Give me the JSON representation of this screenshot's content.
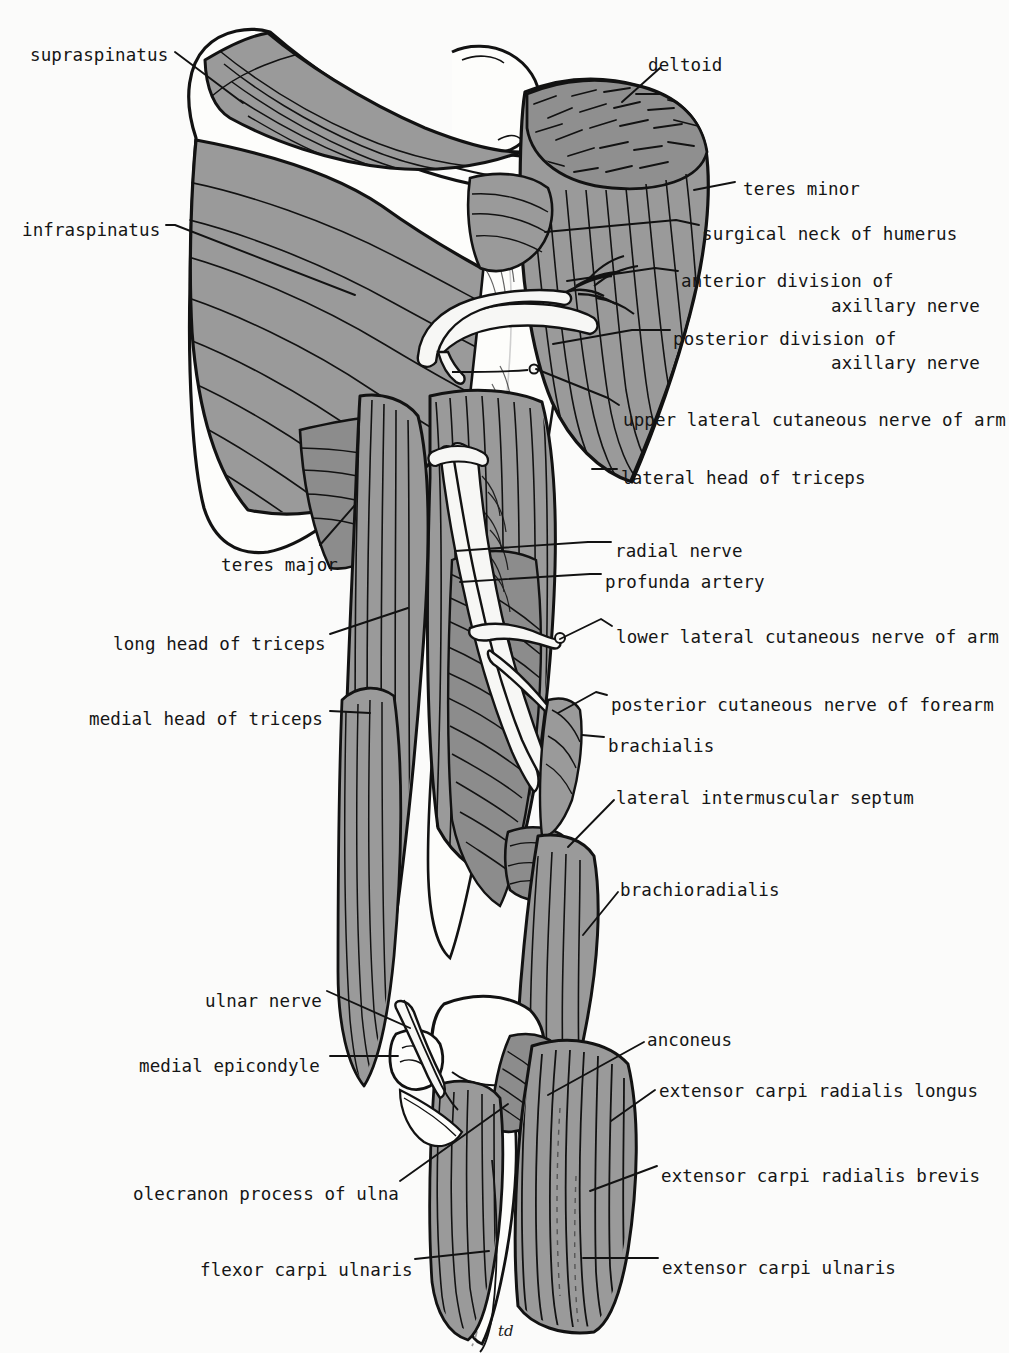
{
  "figure": {
    "signature": "td",
    "palette": {
      "background": "#fbfbfa",
      "muscle_gray": "#9a9a9a",
      "muscle_gray_dark": "#868686",
      "bone_white": "#fdfdfb",
      "nerve_white": "#f7f7f5",
      "outline": "#121212",
      "text": "#151515"
    }
  },
  "labels_left": [
    {
      "id": "supraspinatus",
      "text": "supraspinatus",
      "x": 30,
      "y": 47,
      "leader": [
        [
          175,
          52
        ],
        [
          243,
          103
        ]
      ]
    },
    {
      "id": "infraspinatus",
      "text": "infraspinatus",
      "x": 22,
      "y": 222,
      "leader": [
        [
          166,
          225
        ],
        [
          175,
          225
        ],
        [
          355,
          295
        ]
      ]
    },
    {
      "id": "teres-major",
      "text": "teres major",
      "x": 221,
      "y": 557,
      "leader": [
        [
          320,
          545
        ],
        [
          355,
          505
        ]
      ]
    },
    {
      "id": "long-head-of-triceps",
      "text": "long head of triceps",
      "x": 113,
      "y": 636,
      "leader": [
        [
          330,
          634
        ],
        [
          408,
          608
        ]
      ]
    },
    {
      "id": "medial-head-of-triceps",
      "text": "medial head of triceps",
      "x": 89,
      "y": 711,
      "leader": [
        [
          330,
          711
        ],
        [
          370,
          713
        ]
      ]
    },
    {
      "id": "ulnar-nerve",
      "text": "ulnar nerve",
      "x": 205,
      "y": 993,
      "leader": [
        [
          327,
          991
        ],
        [
          410,
          1028
        ]
      ]
    },
    {
      "id": "medial-epicondyle",
      "text": "medial epicondyle",
      "x": 139,
      "y": 1058,
      "leader": [
        [
          330,
          1056
        ],
        [
          398,
          1056
        ]
      ]
    },
    {
      "id": "olecranon-process",
      "text": "olecranon process of ulna",
      "x": 133,
      "y": 1186,
      "leader": [
        [
          400,
          1181
        ],
        [
          508,
          1104
        ]
      ]
    },
    {
      "id": "flexor-carpi-ulnaris",
      "text": "flexor carpi ulnaris",
      "x": 200,
      "y": 1262,
      "leader": [
        [
          415,
          1259
        ],
        [
          489,
          1251
        ]
      ]
    }
  ],
  "labels_right": [
    {
      "id": "deltoid",
      "text": "deltoid",
      "x": 648,
      "y": 57,
      "leader": [
        [
          660,
          68
        ],
        [
          622,
          102
        ]
      ]
    },
    {
      "id": "teres-minor",
      "text": "teres minor",
      "x": 743,
      "y": 181,
      "leader": [
        [
          735,
          182
        ],
        [
          694,
          190
        ]
      ]
    },
    {
      "id": "surgical-neck-of-humerus",
      "text": "surgical neck of humerus",
      "x": 702,
      "y": 226,
      "leader": [
        [
          699,
          225
        ],
        [
          676,
          220
        ],
        [
          545,
          232
        ]
      ]
    },
    {
      "id": "anterior-division-of",
      "text": "anterior division of",
      "x": 681,
      "y": 273,
      "leader": [
        [
          678,
          271
        ],
        [
          655,
          268
        ],
        [
          567,
          281
        ]
      ]
    },
    {
      "id": "axillary-nerve-1",
      "text": "axillary nerve",
      "x": 831,
      "y": 298,
      "leader": null
    },
    {
      "id": "posterior-division-of",
      "text": "posterior division of",
      "x": 673,
      "y": 331,
      "leader": [
        [
          670,
          330
        ],
        [
          632,
          330
        ],
        [
          553,
          344
        ]
      ]
    },
    {
      "id": "axillary-nerve-2",
      "text": "axillary nerve",
      "x": 831,
      "y": 355,
      "leader": null
    },
    {
      "id": "upper-lateral-cutaneous-arm",
      "text": "upper lateral cutaneous nerve of arm",
      "x": 623,
      "y": 412,
      "leader": [
        [
          619,
          405
        ],
        [
          608,
          398
        ],
        [
          536,
          369
        ]
      ]
    },
    {
      "id": "lateral-head-of-triceps",
      "text": "lateral head of triceps",
      "x": 621,
      "y": 470,
      "leader": [
        [
          617,
          469
        ],
        [
          592,
          469
        ]
      ]
    },
    {
      "id": "radial-nerve",
      "text": "radial nerve",
      "x": 615,
      "y": 543,
      "leader": [
        [
          611,
          542
        ],
        [
          588,
          542
        ],
        [
          455,
          551
        ]
      ]
    },
    {
      "id": "profunda-artery",
      "text": "profunda  artery",
      "x": 605,
      "y": 574,
      "leader": [
        [
          601,
          574
        ],
        [
          590,
          574
        ],
        [
          460,
          582
        ]
      ]
    },
    {
      "id": "lower-lateral-cutaneous-arm",
      "text": "lower lateral cutaneous nerve of arm",
      "x": 616,
      "y": 629,
      "leader": [
        [
          612,
          626
        ],
        [
          601,
          619
        ],
        [
          560,
          639
        ]
      ]
    },
    {
      "id": "posterior-cutaneous-forearm",
      "text": "posterior cutaneous nerve of forearm",
      "x": 611,
      "y": 697,
      "leader": [
        [
          607,
          695
        ],
        [
          596,
          692
        ],
        [
          558,
          713
        ]
      ]
    },
    {
      "id": "brachialis",
      "text": "brachialis",
      "x": 608,
      "y": 738,
      "leader": [
        [
          604,
          737
        ],
        [
          582,
          735
        ]
      ]
    },
    {
      "id": "lateral-intermuscular-septum",
      "text": "lateral intermuscular septum",
      "x": 616,
      "y": 790,
      "leader": [
        [
          614,
          800
        ],
        [
          568,
          847
        ]
      ]
    },
    {
      "id": "brachioradialis",
      "text": "brachioradialis",
      "x": 620,
      "y": 882,
      "leader": [
        [
          618,
          892
        ],
        [
          583,
          935
        ]
      ]
    },
    {
      "id": "anconeus",
      "text": "anconeus",
      "x": 647,
      "y": 1032,
      "leader": [
        [
          644,
          1042
        ],
        [
          548,
          1095
        ]
      ]
    },
    {
      "id": "extensor-carpi-radialis-longus",
      "text": "extensor carpi radialis longus",
      "x": 659,
      "y": 1083,
      "leader": [
        [
          655,
          1090
        ],
        [
          611,
          1121
        ]
      ]
    },
    {
      "id": "extensor-carpi-radialis-brevis",
      "text": "extensor carpi radialis brevis",
      "x": 661,
      "y": 1168,
      "leader": [
        [
          657,
          1166
        ],
        [
          590,
          1191
        ]
      ]
    },
    {
      "id": "extensor-carpi-ulnaris",
      "text": "extensor carpi ulnaris",
      "x": 662,
      "y": 1260,
      "leader": [
        [
          658,
          1258
        ],
        [
          583,
          1258
        ]
      ]
    }
  ]
}
